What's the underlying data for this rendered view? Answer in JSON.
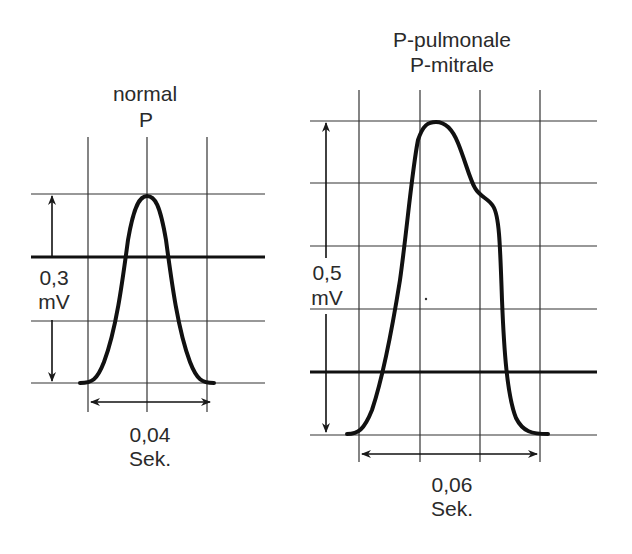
{
  "colors": {
    "ink": "#1a1a1a",
    "grid": "#333333",
    "background": "#ffffff"
  },
  "left_panel": {
    "title_line1": "normal",
    "title_line2": "P",
    "amplitude_value": "0,3",
    "amplitude_unit": "mV",
    "duration_value": "0,04",
    "duration_unit": "Sek."
  },
  "right_panel": {
    "title_line1": "P-pulmonale",
    "title_line2": "P-mitrale",
    "amplitude_value": "0,5",
    "amplitude_unit": "mV",
    "duration_value": "0,06",
    "duration_unit": "Sek."
  }
}
